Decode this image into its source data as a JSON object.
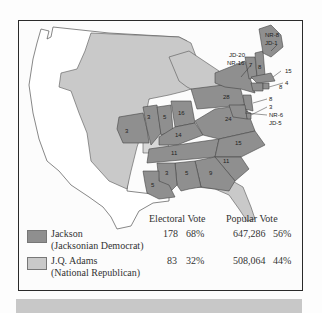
{
  "colors": {
    "jackson": "#8f8f8f",
    "adams": "#c9c9c9",
    "territory": "#ffffff",
    "border": "#2a2a2a"
  },
  "map": {
    "state_labels": [
      {
        "id": "missouri",
        "text": "3"
      },
      {
        "id": "illinois",
        "text": "3"
      },
      {
        "id": "indiana",
        "text": "5"
      },
      {
        "id": "ohio",
        "text": "16"
      },
      {
        "id": "kentucky",
        "text": "14"
      },
      {
        "id": "tennessee",
        "text": "11"
      },
      {
        "id": "pennsylvania",
        "text": "28"
      },
      {
        "id": "virginia",
        "text": "24"
      },
      {
        "id": "north-carolina",
        "text": "15"
      },
      {
        "id": "south-carolina",
        "text": "11"
      },
      {
        "id": "georgia",
        "text": "9"
      },
      {
        "id": "alabama",
        "text": "5"
      },
      {
        "id": "mississippi",
        "text": "3"
      },
      {
        "id": "louisiana",
        "text": "5"
      },
      {
        "id": "vermont",
        "text": "7"
      },
      {
        "id": "new-hampshire",
        "text": "8"
      },
      {
        "id": "massachusetts",
        "text": "15"
      },
      {
        "id": "rhode-island",
        "text": "4"
      },
      {
        "id": "connecticut",
        "text": "8"
      },
      {
        "id": "new-jersey",
        "text": "8"
      },
      {
        "id": "delaware",
        "text": "3"
      }
    ],
    "split_labels": {
      "maine_nr": "NR-8",
      "maine_jd": "JD-1",
      "new_york_jd": "JD-20",
      "new_york_nr": "NR-16",
      "maryland_nr": "NR-6",
      "maryland_jd": "JD-5"
    }
  },
  "legend": {
    "headers": {
      "electoral": "Electoral Vote",
      "popular": "Popular Vote"
    },
    "rows": [
      {
        "name": "Jackson",
        "party": "(Jacksonian Democrat)",
        "ev": "178",
        "ev_pct": "68%",
        "pv": "647,286",
        "pv_pct": "56%"
      },
      {
        "name": "J.Q. Adams",
        "party": "(National Republican)",
        "ev": "83",
        "ev_pct": "32%",
        "pv": "508,064",
        "pv_pct": "44%"
      }
    ]
  }
}
